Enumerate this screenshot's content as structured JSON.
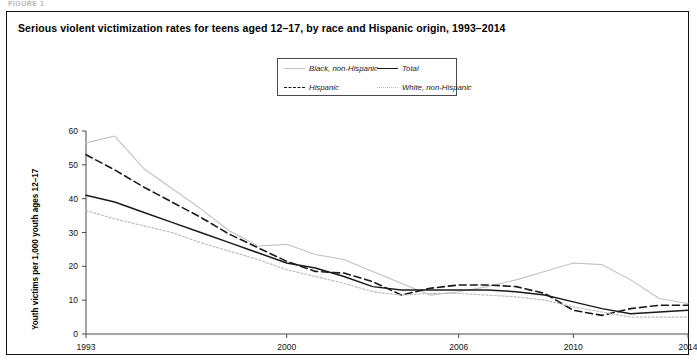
{
  "figure_caption": "FIGURE 1",
  "title": "Serious violent victimization rates for teens aged 12–17, by race and Hispanic origin, 1993–2014",
  "legend": {
    "items": [
      {
        "label": "Black, non-Hispanic",
        "style": "dotted-light",
        "color": "#c2c2c2"
      },
      {
        "label": "Total",
        "style": "solid",
        "color": "#1a1a1a"
      },
      {
        "label": "Hispanic",
        "style": "dashed",
        "color": "#1a1a1a"
      },
      {
        "label": "White, non-Hispanic",
        "style": "dotted-fine",
        "color": "#bdbdbd"
      }
    ]
  },
  "axes": {
    "ylabel": "Youth victims per 1,000 youth ages 12–17",
    "yticks": [
      "0",
      "10",
      "20",
      "30",
      "40",
      "50",
      "60"
    ],
    "xticks": [
      "1993",
      "2000",
      "2006",
      "2010",
      "2014"
    ],
    "xlabel": ""
  },
  "chart_data": {
    "type": "line",
    "title": "Serious violent victimization rates for teens aged 12–17, by race and Hispanic origin, 1993–2014",
    "xlabel": "",
    "ylabel": "Youth victims per 1,000 youth ages 12–17",
    "ylim": [
      0,
      60
    ],
    "xlim": [
      1993,
      2014
    ],
    "ytick_values": [
      0,
      10,
      20,
      30,
      40,
      50,
      60
    ],
    "xtick_values": [
      1993,
      2000,
      2006,
      2010,
      2014
    ],
    "grid": false,
    "legend_position": "top-center",
    "x": [
      1993,
      1994,
      1995,
      1996,
      1997,
      1998,
      1999,
      2000,
      2001,
      2002,
      2003,
      2004,
      2005,
      2006,
      2007,
      2008,
      2009,
      2010,
      2011,
      2012,
      2013,
      2014
    ],
    "series": [
      {
        "name": "Black, non-Hispanic",
        "style": "dotted-light",
        "color": "#c2c2c2",
        "values": [
          56.5,
          58.5,
          49.0,
          43.0,
          37.0,
          30.5,
          26.0,
          26.5,
          23.5,
          22.0,
          18.5,
          15.0,
          11.5,
          12.5,
          14.0,
          16.0,
          18.5,
          21.0,
          20.5,
          16.0,
          10.5,
          9.0
        ]
      },
      {
        "name": "Total",
        "style": "solid",
        "color": "#1a1a1a",
        "values": [
          41.0,
          39.0,
          36.0,
          33.0,
          30.0,
          27.0,
          24.0,
          21.0,
          19.5,
          17.0,
          14.0,
          13.0,
          13.0,
          13.0,
          13.0,
          12.5,
          11.5,
          9.5,
          7.5,
          6.0,
          6.5,
          7.0
        ]
      },
      {
        "name": "Hispanic",
        "style": "dashed",
        "color": "#1a1a1a",
        "values": [
          53.0,
          48.5,
          43.5,
          39.0,
          34.5,
          29.5,
          25.5,
          21.5,
          18.5,
          18.0,
          15.5,
          11.5,
          13.5,
          14.5,
          14.5,
          14.0,
          12.0,
          7.0,
          5.5,
          7.5,
          8.5,
          8.5
        ]
      },
      {
        "name": "White, non-Hispanic",
        "style": "dotted-fine",
        "color": "#bdbdbd",
        "values": [
          36.5,
          34.0,
          32.0,
          30.0,
          27.0,
          24.5,
          22.0,
          19.0,
          17.0,
          15.0,
          12.5,
          11.5,
          12.0,
          12.0,
          11.5,
          11.0,
          10.0,
          8.0,
          6.5,
          5.0,
          5.0,
          5.0
        ]
      }
    ]
  }
}
